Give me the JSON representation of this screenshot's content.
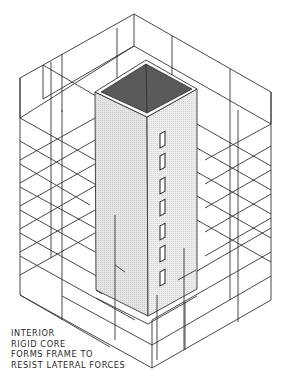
{
  "figure": {
    "type": "isometric architectural diagram",
    "colors": {
      "line": "#333333",
      "core_face_left": "#dcdcdc",
      "core_face_right": "#e6e6e6",
      "core_top": "#5a5a5a",
      "background": "#ffffff"
    },
    "core_openings_count": 7
  },
  "caption": {
    "lines": [
      "INTERIOR",
      "RIGID CORE",
      "FORMS FRAME TO",
      "RESIST LATERAL FORCES"
    ]
  }
}
